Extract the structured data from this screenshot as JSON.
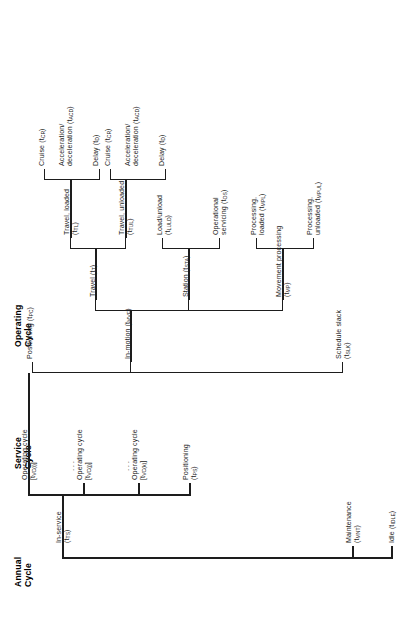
{
  "figure": {
    "type": "hierarchical-tree-diagram",
    "orientation": "rotated-90-ccw"
  },
  "column_headings": [
    {
      "id": "annual",
      "line1": "Annual",
      "line2": "Cycle"
    },
    {
      "id": "service",
      "line1": "Service",
      "line2": "Cycle"
    },
    {
      "id": "operating",
      "line1": "Operating",
      "line2": "Cycle"
    }
  ],
  "nodes": {
    "annual_cycle": [
      {
        "name": "in-service",
        "line1": "In-service",
        "line2": "(t",
        "sub": "TS",
        "line3": ")"
      },
      {
        "name": "maintenance",
        "line1": "Maintenance",
        "line2": "(t",
        "sub": "MNT",
        "line3": ")"
      },
      {
        "name": "idle",
        "line1": "Idle (t",
        "sub": "IDLE",
        "line3": ")"
      }
    ],
    "service_cycle": [
      {
        "name": "operating-cycle-i",
        "line1": "Operating cycle",
        "line2": "[t",
        "sub": "VC(i)",
        "line3": "]"
      },
      {
        "name": "operating-cycle-j",
        "line1": "Operating cycle",
        "line2": "[t",
        "sub": "VC(j)",
        "line3": "]"
      },
      {
        "name": "operating-cycle-k",
        "line1": "Operating cycle",
        "line2": "[t",
        "sub": "VC(k)",
        "line3": "]"
      },
      {
        "name": "positioning-ps",
        "line1": "Positioning",
        "line2": "(t",
        "sub": "PS",
        "line3": ")"
      }
    ],
    "operating_cycle": [
      {
        "name": "positioning-pc",
        "line1": "Positioning (t",
        "sub": "PC",
        "line3": ")"
      },
      {
        "name": "in-motion",
        "line1": "In-motion (t",
        "sub": "MVE",
        "line3": ")"
      },
      {
        "name": "schedule-slack",
        "line1": "Schedule slack",
        "line2": "(t",
        "sub": "SLK",
        "line3": ")"
      }
    ],
    "in_motion_children": [
      {
        "name": "travel",
        "line1": "Travel (t",
        "sub": "T",
        "line3": ")"
      },
      {
        "name": "station",
        "line1": "Station (t",
        "sub": "STA",
        "line3": ")"
      },
      {
        "name": "movement-processing",
        "line1": "Movement processing",
        "line2": "(t",
        "sub": "MP",
        "line3": ")"
      }
    ],
    "travel_children": [
      {
        "name": "travel-loaded",
        "line1": "Travel, loaded",
        "line2": "(t",
        "sub": "TL",
        "line3": ")"
      },
      {
        "name": "travel-unloaded",
        "line1": "Travel, unloaded",
        "line2": "(t",
        "sub": "TUL",
        "line3": ")"
      }
    ],
    "station_children": [
      {
        "name": "load-unload",
        "line1": "Load/unload",
        "line2": "(t",
        "sub": "LULD",
        "line3": ")"
      },
      {
        "name": "operational-servicing",
        "line1": "Operational",
        "line2": "servicing (t",
        "sub": "OS",
        "line3": ")"
      }
    ],
    "movement_processing_children": [
      {
        "name": "processing-loaded",
        "line1": "Processing,",
        "line2": "loaded (t",
        "sub": "MPL",
        "line3": ")"
      },
      {
        "name": "processing-unloaded",
        "line1": "Processing,",
        "line2": "unloaded (t",
        "sub": "MPUL",
        "line3": ")"
      }
    ],
    "travel_loaded_children": [
      {
        "name": "cruise-1",
        "line1": "Cruise (t",
        "sub": "CR",
        "line3": ")"
      },
      {
        "name": "accel-decel-1",
        "line1": "Acceleration/",
        "line2": "deceleration (t",
        "sub": "ACD",
        "line3": ")"
      },
      {
        "name": "delay-1",
        "line1": "Delay (t",
        "sub": "D",
        "line3": ")"
      }
    ],
    "travel_unloaded_children": [
      {
        "name": "cruise-2",
        "line1": "Cruise (t",
        "sub": "CR",
        "line3": ")"
      },
      {
        "name": "accel-decel-2",
        "line1": "Acceleration/",
        "line2": "deceleration (t",
        "sub": "ACD",
        "line3": ")"
      },
      {
        "name": "delay-2",
        "line1": "Delay (t",
        "sub": "D",
        "line3": ")"
      }
    ]
  },
  "ellipses": {
    "glyph": "..."
  },
  "colors": {
    "ink": "#1d1d1d",
    "background": "#ffffff"
  }
}
